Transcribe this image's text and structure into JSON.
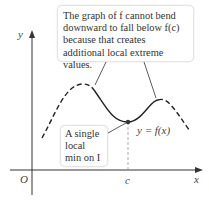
{
  "callouts": {
    "top": "The graph of f cannot bend downward to fall below f(c) because that creates additional local extreme values.",
    "left": "A single local min on I"
  },
  "labels": {
    "y_axis": "y",
    "x_axis": "x",
    "origin": "O",
    "c": "c",
    "curve": "y = f(x)"
  },
  "colors": {
    "curve": "#222222",
    "axis": "#333333",
    "guide": "#999999"
  }
}
